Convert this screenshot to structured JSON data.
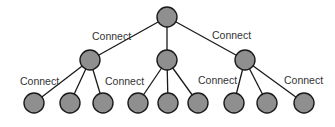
{
  "diagram": {
    "type": "tree",
    "colors": {
      "node_fill": "#8f8f8f",
      "node_stroke": "#1a1a1a",
      "edge": "#1a1a1a",
      "label": "#333333",
      "background": "#ffffff"
    },
    "nodes": [
      {
        "id": "root",
        "x": 167,
        "y": 17
      },
      {
        "id": "m1",
        "x": 90,
        "y": 60
      },
      {
        "id": "m2",
        "x": 167,
        "y": 60
      },
      {
        "id": "m3",
        "x": 245,
        "y": 60
      },
      {
        "id": "l1",
        "x": 34,
        "y": 103
      },
      {
        "id": "l2",
        "x": 70,
        "y": 103
      },
      {
        "id": "l3",
        "x": 103,
        "y": 103
      },
      {
        "id": "l4",
        "x": 138,
        "y": 103
      },
      {
        "id": "l5",
        "x": 168,
        "y": 103
      },
      {
        "id": "l6",
        "x": 198,
        "y": 103
      },
      {
        "id": "l7",
        "x": 234,
        "y": 103
      },
      {
        "id": "l8",
        "x": 267,
        "y": 103
      },
      {
        "id": "l9",
        "x": 304,
        "y": 103
      }
    ],
    "labels": [
      {
        "text": "Connect",
        "x": 92,
        "y": 40
      },
      {
        "text": "Connect",
        "x": 212,
        "y": 39
      },
      {
        "text": "Connect",
        "x": 20,
        "y": 85
      },
      {
        "text": "Connect",
        "x": 105,
        "y": 85
      },
      {
        "text": "Connect",
        "x": 198,
        "y": 84
      },
      {
        "text": "Connect",
        "x": 284,
        "y": 84
      }
    ]
  }
}
